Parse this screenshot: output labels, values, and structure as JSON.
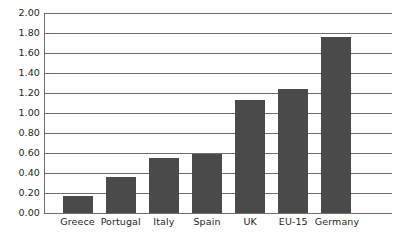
{
  "chart_data": {
    "type": "bar",
    "title": "",
    "subtitle": "",
    "xlabel": "",
    "ylabel": "",
    "categories": [
      "Greece",
      "Portugal",
      "Italy",
      "Spain",
      "UK",
      "EU-15",
      "Germany"
    ],
    "values": [
      0.17,
      0.36,
      0.55,
      0.59,
      1.13,
      1.24,
      1.76
    ],
    "series": [
      {
        "name": "",
        "values": [
          0.17,
          0.36,
          0.55,
          0.59,
          1.13,
          1.24,
          1.76
        ]
      }
    ],
    "ylim": [
      0.0,
      2.0
    ],
    "ytick_step": 0.2,
    "ytick_labels": [
      "2.00",
      "1.80",
      "1.60",
      "1.40",
      "1.20",
      "1.00",
      "0.80",
      "0.60",
      "0.40",
      "0.20",
      "0.00"
    ],
    "ytick_values": [
      2.0,
      1.8,
      1.6,
      1.4,
      1.2,
      1.0,
      0.8,
      0.6,
      0.4,
      0.2,
      0.0
    ],
    "grid": true,
    "grid_orientation": "horizontal",
    "legend": false,
    "legend_position": "none",
    "annotations": [],
    "colors": {
      "bar_fill": "#4a4a4a",
      "gridline": "#6d6e70",
      "axis": "#6d6e70",
      "text": "#231f20",
      "background": "#ffffff"
    }
  }
}
